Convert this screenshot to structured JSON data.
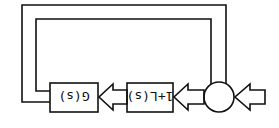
{
  "diagram": {
    "type": "block-diagram",
    "orientation": "rotated-180",
    "blocks": [
      {
        "id": "g",
        "label": "G(s)"
      },
      {
        "id": "l",
        "label": "1+L(s)"
      }
    ],
    "summing_junction": {
      "id": "sum"
    },
    "colors": {
      "stroke": "#111111",
      "background": "#ffffff"
    }
  }
}
